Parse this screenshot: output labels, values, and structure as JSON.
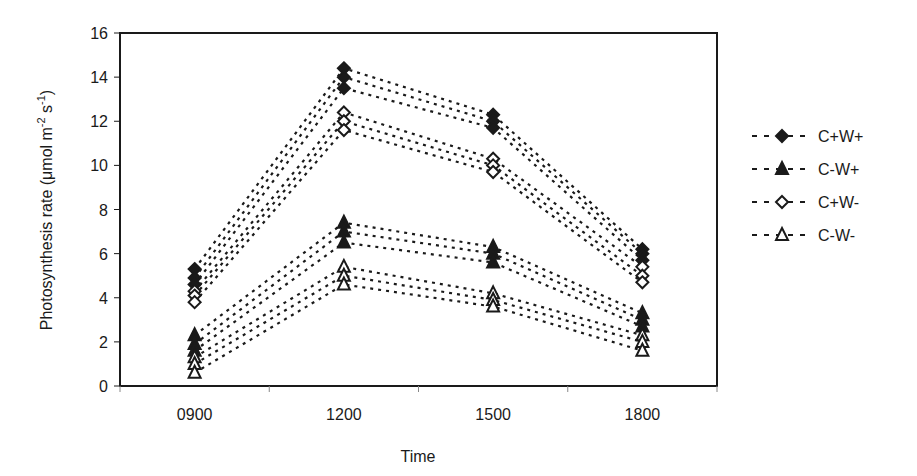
{
  "chart_data": {
    "type": "line",
    "title": "",
    "xlabel": "Time",
    "ylabel": "Photosynthesis rate (µmol m-2 s-1)",
    "ylabel_parts": {
      "main": "Photosynthesis rate (μmol m",
      "sup1": "-2",
      "mid": " s",
      "sup2": "-1",
      "end": ")"
    },
    "categories": [
      "0900",
      "1200",
      "1500",
      "1800"
    ],
    "ylim": [
      0,
      16
    ],
    "yticks": [
      0,
      2,
      4,
      6,
      8,
      10,
      12,
      14,
      16
    ],
    "grid": false,
    "legend_position": "right",
    "line_style": "dotted",
    "note": "Each treatment drawn as three dotted lines: upper bound, mean, lower bound",
    "series": [
      {
        "name": "C+W+",
        "marker": "filled-diamond",
        "upper": [
          5.3,
          14.4,
          12.3,
          6.2
        ],
        "mean": [
          4.9,
          14.0,
          12.0,
          6.0
        ],
        "lower": [
          4.6,
          13.5,
          11.7,
          5.7
        ]
      },
      {
        "name": "C-W+",
        "marker": "filled-triangle",
        "upper": [
          2.3,
          7.4,
          6.3,
          3.3
        ],
        "mean": [
          1.9,
          7.0,
          6.0,
          3.0
        ],
        "lower": [
          1.6,
          6.5,
          5.6,
          2.7
        ]
      },
      {
        "name": "C+W-",
        "marker": "open-diamond",
        "upper": [
          4.3,
          12.4,
          10.3,
          5.4
        ],
        "mean": [
          4.1,
          12.0,
          10.0,
          5.0
        ],
        "lower": [
          3.8,
          11.6,
          9.7,
          4.7
        ]
      },
      {
        "name": "C-W-",
        "marker": "open-triangle",
        "upper": [
          1.3,
          5.4,
          4.2,
          2.3
        ],
        "mean": [
          1.0,
          5.0,
          3.9,
          2.0
        ],
        "lower": [
          0.6,
          4.6,
          3.6,
          1.6
        ]
      }
    ]
  },
  "colors": {
    "ink": "#1a1a1a",
    "background": "#ffffff"
  }
}
